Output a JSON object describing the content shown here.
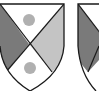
{
  "figure": {
    "shields": [
      {
        "name": "shield-left",
        "division": "per saltire",
        "fields": {
          "chief": {
            "tincture": "white",
            "charge": "roundel",
            "charge_color": "#b0b0b0"
          },
          "dexter": {
            "tincture": "dark-gray",
            "color": "#7a7a7a"
          },
          "sinister": {
            "tincture": "light-gray",
            "color": "#c4c4c4"
          },
          "base": {
            "tincture": "white",
            "charge": "roundel",
            "charge_color": "#b0b0b0"
          }
        }
      },
      {
        "name": "shield-right-partial",
        "division": "per saltire",
        "fields": {
          "dexter": {
            "tincture": "dark-gray",
            "color": "#7a7a7a"
          }
        }
      }
    ],
    "colors": {
      "outline": "#1a1a1a",
      "background": "#ffffff"
    }
  }
}
